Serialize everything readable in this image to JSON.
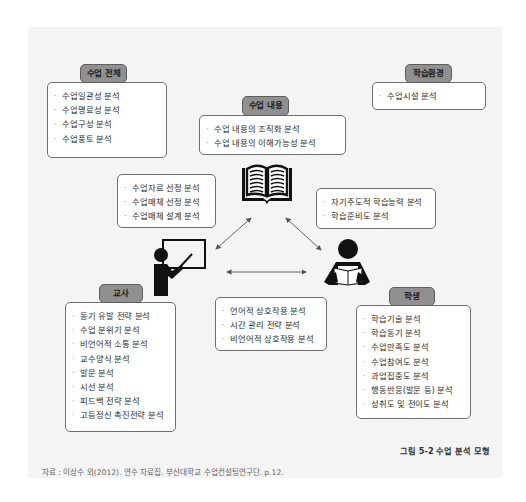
{
  "figure": {
    "caption": "그림 5-2  수업 분석 모형",
    "source": "자료 : 이상수 외(2012). 연수 자료집. 부산대학교 수업컨설팅연구단. p.12."
  },
  "groups": {
    "overall": {
      "title": "수업 전체",
      "items": [
        "수업일관성 분석",
        "수업명료성 분석",
        "수업구성 분석",
        "수업풍토 분석"
      ]
    },
    "content": {
      "title": "수업 내용",
      "items": [
        "수업 내용의 조직화 분석",
        "수업 내용의 이해가능성 분석"
      ]
    },
    "environment": {
      "title": "학습환경",
      "items": [
        "수업시설 분석"
      ]
    },
    "teacher_content": {
      "items": [
        "수업자료 선정 분석",
        "수업매체 선정 분석",
        "수업매체 설계 분석"
      ]
    },
    "student_content": {
      "items": [
        "자기주도적 학습능력 분석",
        "학습준비도 분석"
      ]
    },
    "teacher_student": {
      "items": [
        "언어적 상호작용 분석",
        "시간 관리 전략 분석",
        "비언어적 상호작용 분석"
      ]
    },
    "teacher": {
      "title": "교사",
      "items": [
        "동기 유발 전략 분석",
        "수업 분위기 분석",
        "비언어적 소통 분석",
        "교수양식 분석",
        "발문 분석",
        "시선 분석",
        "피드백 전략 분석",
        "고등정신 촉진전략 분석"
      ]
    },
    "student": {
      "title": "학생",
      "items": [
        "학습기술 분석",
        "학습동기 분석",
        "수업만족도 분석",
        "수업참여도 분석",
        "과업집중도 분석",
        "행동반응(발문 등) 분석",
        "성취도 및 전이도 분석"
      ]
    }
  },
  "icons": {
    "content": "open-book-icon",
    "teacher": "teacher-at-board-icon",
    "student": "student-reading-icon"
  },
  "colors": {
    "panel_bg": "#f4f4f4",
    "tab_bg": "#909090",
    "box_border": "#6e6e6e",
    "icon": "#111111"
  }
}
